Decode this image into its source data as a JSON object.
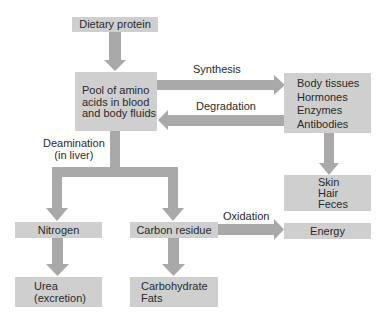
{
  "diagram": {
    "colors": {
      "box_fill": "#cfcfcf",
      "arrow_fill": "#a9a9a9",
      "text": "#2a2a2a",
      "background": "#ffffff"
    },
    "nodes": {
      "dietary_protein": {
        "label": "Dietary protein"
      },
      "amino_pool": {
        "lines": [
          "Pool of amino",
          "acids in blood",
          "and body fluids"
        ]
      },
      "body_tissues": {
        "lines": [
          "Body tissues",
          "Hormones",
          "Enzymes",
          "Antibodies"
        ]
      },
      "skin_hair_feces": {
        "lines": [
          "Skin",
          "Hair",
          "Feces"
        ]
      },
      "nitrogen": {
        "label": "Nitrogen"
      },
      "carbon_residue": {
        "label": "Carbon residue"
      },
      "energy": {
        "label": "Energy"
      },
      "urea": {
        "lines": [
          "Urea",
          "(excretion)"
        ]
      },
      "carbohydrate_fats": {
        "lines": [
          "Carbohydrate",
          "Fats"
        ]
      }
    },
    "edges": {
      "synthesis": {
        "label": "Synthesis",
        "from": "amino_pool",
        "to": "body_tissues"
      },
      "degradation": {
        "label": "Degradation",
        "from": "body_tissues",
        "to": "amino_pool"
      },
      "deamination": {
        "lines": [
          "Deamination",
          "(in liver)"
        ],
        "from": "amino_pool",
        "to": [
          "nitrogen",
          "carbon_residue"
        ]
      },
      "oxidation": {
        "label": "Oxidation",
        "from": "carbon_residue",
        "to": "energy"
      }
    }
  }
}
